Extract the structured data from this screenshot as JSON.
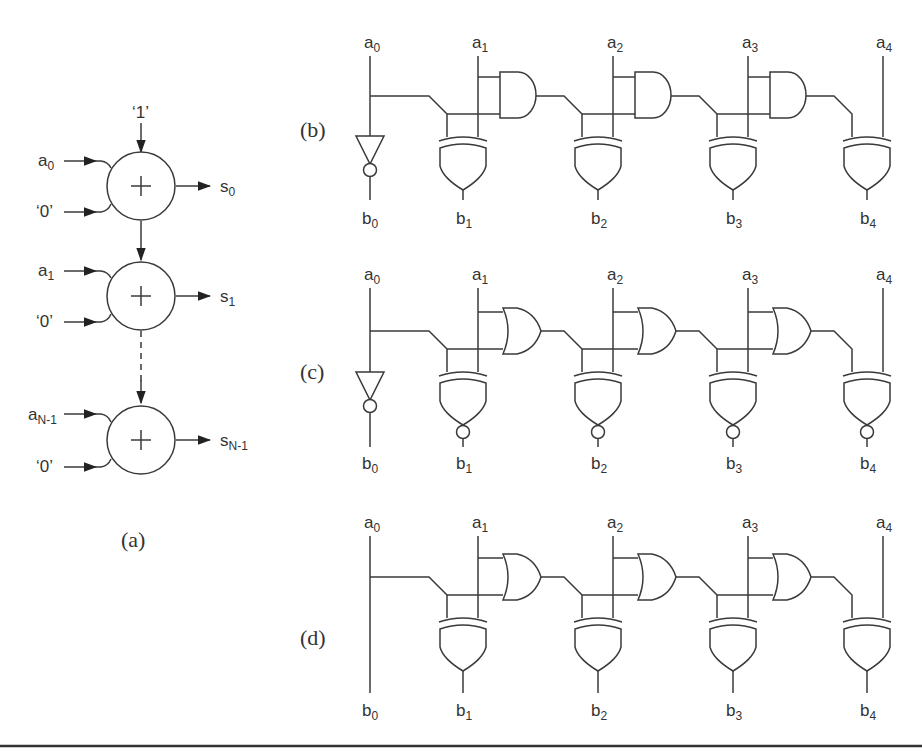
{
  "figure": {
    "panels": {
      "a": {
        "caption": "(a)",
        "carry_in": "‘1’",
        "stages": [
          {
            "input": "a",
            "input_sub": "0",
            "zero": "‘0’",
            "output": "s",
            "output_sub": "0"
          },
          {
            "input": "a",
            "input_sub": "1",
            "zero": "‘0’",
            "output": "s",
            "output_sub": "1"
          },
          {
            "input": "a",
            "input_sub": "N-1",
            "zero": "‘0’",
            "output": "s",
            "output_sub": "N-1"
          }
        ],
        "adder_symbol": "+"
      },
      "b": {
        "caption": "(b)",
        "carry_gate": "AND",
        "sum_gate": "XOR",
        "b0_gate": "NOT"
      },
      "c": {
        "caption": "(c)",
        "carry_gate": "OR",
        "sum_gate": "XNOR",
        "b0_gate": "NOT"
      },
      "d": {
        "caption": "(d)",
        "carry_gate": "OR",
        "sum_gate": "XOR",
        "b0_gate": "WIRE"
      }
    },
    "inputs": [
      {
        "name": "a",
        "sub": "0"
      },
      {
        "name": "a",
        "sub": "1"
      },
      {
        "name": "a",
        "sub": "2"
      },
      {
        "name": "a",
        "sub": "3"
      },
      {
        "name": "a",
        "sub": "4"
      }
    ],
    "outputs": [
      {
        "name": "b",
        "sub": "0"
      },
      {
        "name": "b",
        "sub": "1"
      },
      {
        "name": "b",
        "sub": "2"
      },
      {
        "name": "b",
        "sub": "3"
      },
      {
        "name": "b",
        "sub": "4"
      }
    ]
  }
}
